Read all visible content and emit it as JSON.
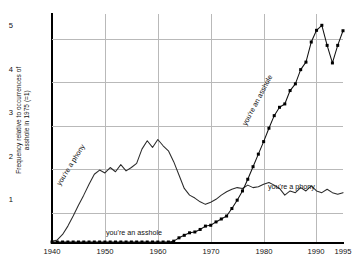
{
  "chart_data": {
    "type": "line",
    "title": "",
    "xlabel": "",
    "ylabel": "Frequency relative to occurrences of\nasshole in 1975 (=1)",
    "xlim": [
      1940,
      1995
    ],
    "ylim": [
      0,
      5.45
    ],
    "grid": true,
    "legend": "none (inline annotations)",
    "xticks": [
      "1940",
      "1950",
      "1960",
      "1970",
      "1980",
      "1990",
      "1995"
    ],
    "yticks": [
      "1",
      "2",
      "3",
      "4",
      "5"
    ],
    "annotations": [
      {
        "text": "you're a phony",
        "x": 1945,
        "y": 0.9,
        "rotation": -58
      },
      {
        "text": "you're an asshole",
        "x": 1952,
        "y": 0.22,
        "rotation": 0
      },
      {
        "text": "you're an asshole",
        "x": 1985,
        "y": 3.3,
        "rotation": -62
      },
      {
        "text": "you're a phony",
        "x": 1987,
        "y": 1.55,
        "rotation": 0
      }
    ],
    "series": [
      {
        "name": "you're a phony",
        "marker": "none",
        "x": [
          1940,
          1941,
          1942,
          1943,
          1944,
          1945,
          1946,
          1947,
          1948,
          1949,
          1950,
          1951,
          1952,
          1953,
          1954,
          1955,
          1956,
          1957,
          1958,
          1959,
          1960,
          1961,
          1962,
          1963,
          1964,
          1965,
          1966,
          1967,
          1968,
          1969,
          1970,
          1971,
          1972,
          1973,
          1974,
          1975,
          1976,
          1977,
          1978,
          1979,
          1980,
          1981,
          1982,
          1983,
          1984,
          1985,
          1986,
          1987,
          1988,
          1989,
          1990,
          1991,
          1992,
          1993,
          1994,
          1995
        ],
        "values": [
          0.02,
          0.05,
          0.18,
          0.38,
          0.62,
          0.88,
          1.12,
          1.38,
          1.62,
          1.72,
          1.65,
          1.78,
          1.68,
          1.85,
          1.7,
          1.78,
          1.88,
          2.22,
          2.42,
          2.26,
          2.45,
          2.3,
          2.18,
          1.92,
          1.6,
          1.28,
          1.12,
          1.05,
          0.96,
          0.9,
          0.95,
          1.02,
          1.12,
          1.2,
          1.26,
          1.3,
          1.28,
          1.36,
          1.3,
          1.32,
          1.38,
          1.42,
          1.36,
          1.28,
          1.12,
          1.22,
          1.18,
          1.3,
          1.22,
          1.34,
          1.22,
          1.18,
          1.26,
          1.18,
          1.14,
          1.18
        ]
      },
      {
        "name": "you're an asshole",
        "marker": "square",
        "x": [
          1940,
          1941,
          1942,
          1943,
          1944,
          1945,
          1946,
          1947,
          1948,
          1949,
          1950,
          1951,
          1952,
          1953,
          1954,
          1955,
          1956,
          1957,
          1958,
          1959,
          1960,
          1961,
          1962,
          1963,
          1964,
          1965,
          1966,
          1967,
          1968,
          1969,
          1970,
          1971,
          1972,
          1973,
          1974,
          1975,
          1976,
          1977,
          1978,
          1979,
          1980,
          1981,
          1982,
          1983,
          1984,
          1985,
          1986,
          1987,
          1988,
          1989,
          1990,
          1991,
          1992,
          1993,
          1994,
          1995
        ],
        "values": [
          0.0,
          0.0,
          0.0,
          0.0,
          0.0,
          0.0,
          0.0,
          0.0,
          0.0,
          0.0,
          0.0,
          0.0,
          0.0,
          0.0,
          0.0,
          0.0,
          0.0,
          0.0,
          0.0,
          0.0,
          0.0,
          0.0,
          0.0,
          0.02,
          0.1,
          0.16,
          0.22,
          0.24,
          0.3,
          0.38,
          0.4,
          0.48,
          0.55,
          0.62,
          0.8,
          1.0,
          1.22,
          1.5,
          1.8,
          2.1,
          2.4,
          2.72,
          3.02,
          3.22,
          3.3,
          3.62,
          3.78,
          4.12,
          4.3,
          4.78,
          5.06,
          5.18,
          4.7,
          4.28,
          4.7,
          5.05
        ]
      }
    ]
  }
}
